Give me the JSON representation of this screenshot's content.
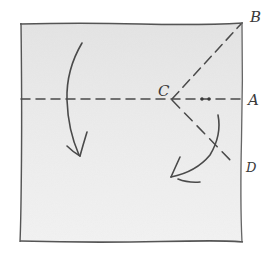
{
  "diagram": {
    "type": "origami-fold-instruction",
    "paper": {
      "corners": [
        [
          20,
          23
        ],
        [
          242,
          23
        ],
        [
          242,
          241
        ],
        [
          20,
          241
        ]
      ],
      "fill_colors": [
        "#e6e6e6",
        "#efefef",
        "#f4f4f4"
      ],
      "stroke": "#555555"
    },
    "points": {
      "A": {
        "label": "A",
        "x": 242,
        "y": 99
      },
      "B": {
        "label": "B",
        "x": 242,
        "y": 23
      },
      "C": {
        "label": "C",
        "x": 172,
        "y": 99
      },
      "D": {
        "label": "D",
        "x": 235,
        "y": 166
      }
    },
    "fold_lines": [
      {
        "name": "horizontal-fold",
        "from": [
          20,
          99
        ],
        "to": [
          242,
          99
        ],
        "style": "dashed"
      },
      {
        "name": "diagonal-fold-cb",
        "from": [
          172,
          99
        ],
        "to": [
          242,
          23
        ],
        "style": "dashed"
      },
      {
        "name": "diagonal-fold-cd",
        "from": [
          172,
          99
        ],
        "to": [
          235,
          166
        ],
        "style": "dashed"
      }
    ],
    "marks": [
      {
        "name": "dot-1",
        "x": 202,
        "y": 99
      },
      {
        "name": "dot-2",
        "x": 209,
        "y": 99
      }
    ],
    "arrows": [
      {
        "name": "left-fold-arrow",
        "direction": "down"
      },
      {
        "name": "right-fold-arrow",
        "direction": "down-left"
      }
    ],
    "line_color": "#4a4a4a"
  }
}
